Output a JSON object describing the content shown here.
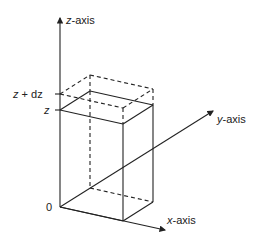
{
  "diagram": {
    "type": "3d-coordinate-box",
    "axes": {
      "z": {
        "label": "z-axis",
        "var": "z",
        "suffix": "-axis"
      },
      "y": {
        "label": "y-axis",
        "var": "y",
        "suffix": "-axis"
      },
      "x": {
        "label": "x-axis",
        "var": "x",
        "suffix": "-axis"
      }
    },
    "origin_label": "0",
    "ticks": {
      "upper": {
        "label": "z + dz",
        "var": "z",
        "op": " + ",
        "term": "dz"
      },
      "lower": {
        "label": "z",
        "var": "z"
      }
    },
    "colors": {
      "stroke": "#222222",
      "background": "#ffffff"
    }
  }
}
